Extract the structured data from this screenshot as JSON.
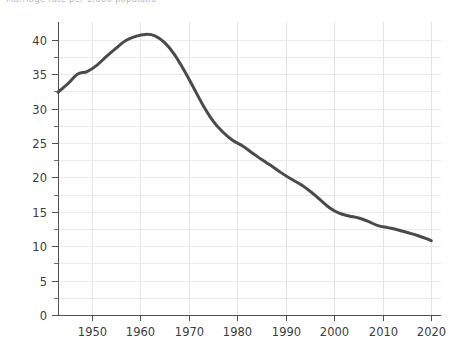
{
  "caption": {
    "text": "Marriage rate per 1,000 population"
  },
  "chart_data": {
    "type": "line",
    "title": "",
    "subtitle": "",
    "xlabel": "",
    "ylabel": "",
    "xlim": [
      1943,
      2022
    ],
    "ylim": [
      0,
      42.6
    ],
    "grid": true,
    "legend": null,
    "legend_position": "none",
    "line_color": "#4a4a4a",
    "line_width": 3.0,
    "grid_color": "#e9e9ec",
    "axis_color": "#4f4f4f",
    "background_color": "#ffffff",
    "x_ticks": [
      1950,
      1960,
      1970,
      1980,
      1990,
      2000,
      2010,
      2020
    ],
    "x_tick_labels": [
      "1950",
      "1960",
      "1970",
      "1980",
      "1990",
      "2000",
      "2010",
      "2020"
    ],
    "y_ticks": [
      0,
      5,
      10,
      15,
      20,
      25,
      30,
      35,
      40
    ],
    "y_tick_labels": [
      "0",
      "5",
      "10",
      "15",
      "20",
      "25",
      "30",
      "35",
      "40"
    ],
    "y_minor_ticks": [
      2.5,
      7.5,
      12.5,
      17.5,
      22.5,
      27.5,
      32.5,
      37.5
    ],
    "series": [
      {
        "name": "rate",
        "x": [
          1943,
          1945,
          1947,
          1949,
          1951,
          1953,
          1955,
          1957,
          1959,
          1961,
          1963,
          1965,
          1967,
          1969,
          1971,
          1973,
          1975,
          1977,
          1979,
          1981,
          1983,
          1985,
          1987,
          1989,
          1991,
          1993,
          1995,
          1997,
          1999,
          2001,
          2003,
          2005,
          2007,
          2009,
          2011,
          2013,
          2015,
          2017,
          2019,
          2020
        ],
        "values": [
          32.4,
          33.6,
          35.0,
          35.4,
          36.3,
          37.6,
          38.8,
          39.9,
          40.5,
          40.8,
          40.6,
          39.6,
          37.9,
          35.6,
          33.0,
          30.4,
          28.2,
          26.6,
          25.4,
          24.6,
          23.6,
          22.6,
          21.7,
          20.7,
          19.8,
          19.0,
          18.0,
          16.8,
          15.6,
          14.8,
          14.4,
          14.1,
          13.6,
          13.0,
          12.7,
          12.4,
          12.0,
          11.6,
          11.1,
          10.8
        ]
      }
    ]
  },
  "axes_geometry": {
    "left_px": 58,
    "right_px": 441,
    "top_px": 22,
    "bottom_px": 315
  }
}
